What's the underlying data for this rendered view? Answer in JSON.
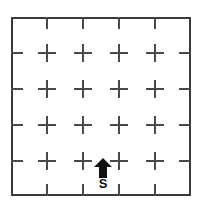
{
  "diagram": {
    "type": "grid-maze",
    "rows": 5,
    "columns": 5,
    "line_color": "#4a4a4a",
    "border_color": "#3a3a3a",
    "background_color": "#ffffff",
    "frame": {
      "x": 11,
      "y": 17,
      "width": 180,
      "height": 179,
      "border_width": 2
    },
    "cell_size": 36,
    "tick": {
      "length": 12,
      "thickness": 2
    },
    "cross": {
      "arm_length": 18,
      "thickness": 2
    },
    "x_ticks": [
      47,
      83,
      119,
      155
    ],
    "y_ticks": [
      53,
      89,
      125,
      161
    ],
    "marker": {
      "label": "S",
      "label_meaning": "start",
      "icon": "up-arrow-icon",
      "direction": "up",
      "color": "#111111",
      "cell_column": 3,
      "cell_row": 5,
      "arrow": {
        "x": 94,
        "y": 158,
        "width": 18,
        "height": 20
      },
      "label_box": {
        "x": 92,
        "y": 177,
        "width": 22,
        "height": 14,
        "font_size": 13
      }
    }
  }
}
